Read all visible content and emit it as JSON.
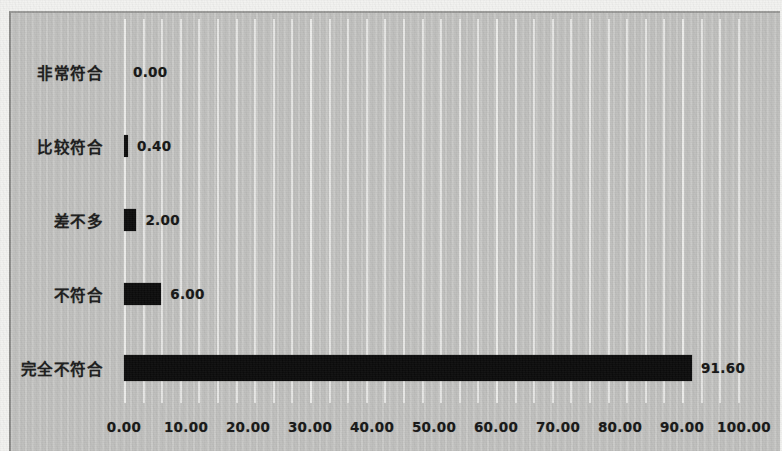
{
  "chart_data": {
    "type": "bar",
    "orientation": "horizontal",
    "title": "",
    "subtitle": "",
    "xlabel": "",
    "ylabel": "",
    "categories": [
      "非常符合",
      "比较符合",
      "差不多",
      "不符合",
      "完全不符合"
    ],
    "values": [
      0.0,
      0.4,
      2.0,
      6.0,
      91.6
    ],
    "value_labels": [
      "0.00",
      "0.40",
      "2.00",
      "6.00",
      "91.60"
    ],
    "xlim": [
      0,
      100
    ],
    "xticks": [
      0,
      10,
      20,
      30,
      40,
      50,
      60,
      70,
      80,
      90,
      100
    ],
    "xtick_labels": [
      "0.00",
      "10.00",
      "20.00",
      "30.00",
      "40.00",
      "50.00",
      "60.00",
      "70.00",
      "80.00",
      "90.00",
      "100.00"
    ],
    "grid": true,
    "grid_axis": "x",
    "grid_minor_step": 3,
    "legend": null,
    "series": [
      {
        "name": "",
        "bar_color": "#0b0b0b",
        "values": [
          0.0,
          0.4,
          2.0,
          6.0,
          91.6
        ]
      }
    ],
    "colors": {
      "bar": "#0b0b0b",
      "plot_background": "#c3c3c1",
      "page_background": "#f2f2f0",
      "gridline": "#e9e9e7",
      "text": "#1b1b1b",
      "frame_border": "#8d8d8b"
    }
  },
  "rows": [
    {
      "label": "非常符合",
      "value_label": "0.00",
      "value": 0.0
    },
    {
      "label": "比较符合",
      "value_label": "0.40",
      "value": 0.4
    },
    {
      "label": "差不多",
      "value_label": "2.00",
      "value": 2.0
    },
    {
      "label": "不符合",
      "value_label": "6.00",
      "value": 6.0
    },
    {
      "label": "完全不符合",
      "value_label": "91.60",
      "value": 91.6
    }
  ],
  "x_axis": {
    "labels": [
      "0.00",
      "10.00",
      "20.00",
      "30.00",
      "40.00",
      "50.00",
      "60.00",
      "70.00",
      "80.00",
      "90.00",
      "100.00"
    ],
    "values": [
      0,
      10,
      20,
      30,
      40,
      50,
      60,
      70,
      80,
      90,
      100
    ]
  }
}
